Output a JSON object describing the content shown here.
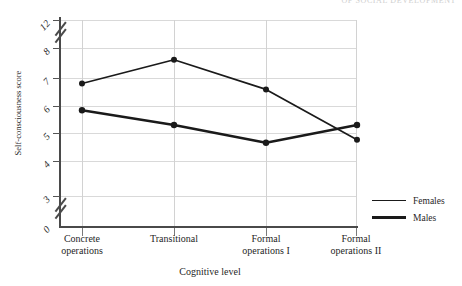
{
  "running_head": "OF SOCIAL DEVELOPMENT",
  "chart_data": {
    "type": "line",
    "title": "",
    "xlabel": "Cognitive level",
    "ylabel": "Self-consciousness score",
    "categories": [
      "Concrete operations",
      "Transitional",
      "Formal operations I",
      "Formal operations II"
    ],
    "series": [
      {
        "name": "Females",
        "values": [
          6.8,
          7.6,
          6.6,
          4.9
        ]
      },
      {
        "name": "Males",
        "values": [
          5.9,
          5.4,
          4.8,
          5.4
        ]
      }
    ],
    "ylim": [
      3,
      12
    ],
    "ytick_labels": [
      "12",
      "8",
      "7",
      "6",
      "5",
      "4",
      "3",
      "0"
    ],
    "yticks": [
      12,
      8,
      7,
      6,
      5,
      4,
      3,
      0
    ],
    "axis_break": true,
    "grid": true,
    "legend_position": "right",
    "line_color": "#1a1a1a",
    "grid_color": "#d9d9d9",
    "axis_color": "#4a4a4a"
  },
  "y_axis": {
    "title": "Self-consciousness score",
    "tick_labels": [
      "12",
      "8",
      "7",
      "6",
      "5",
      "4",
      "3",
      "0"
    ]
  },
  "x_axis": {
    "title": "Cognitive level",
    "tick_labels": [
      {
        "line1": "Concrete",
        "line2": "operations"
      },
      {
        "line1": "Transitional",
        "line2": ""
      },
      {
        "line1": "Formal",
        "line2": "operations I"
      },
      {
        "line1": "Formal",
        "line2": "operations II"
      }
    ]
  },
  "legend": {
    "items": [
      {
        "label": "Females",
        "style": "thin"
      },
      {
        "label": "Males",
        "style": "thick"
      }
    ]
  }
}
